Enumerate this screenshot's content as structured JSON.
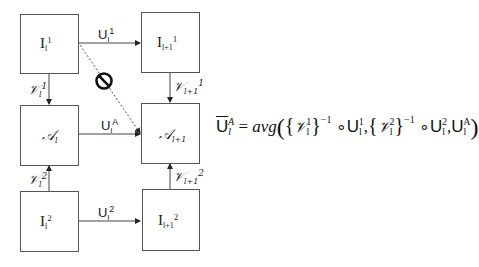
{
  "diagram": {
    "nodes": [
      {
        "id": "I_l_1",
        "base": "I",
        "sub": "l",
        "sup": "1"
      },
      {
        "id": "I_l1_1",
        "base": "I",
        "sub": "l+1",
        "sup": "1"
      },
      {
        "id": "A_l",
        "base": "𝒜",
        "sub": "l",
        "sup": ""
      },
      {
        "id": "A_l1",
        "base": "𝒜",
        "sub": "l+1",
        "sup": ""
      },
      {
        "id": "I_l_2",
        "base": "I",
        "sub": "l",
        "sup": "2"
      },
      {
        "id": "I_l1_2",
        "base": "I",
        "sub": "l+1",
        "sup": "2"
      }
    ],
    "edges": [
      {
        "from": "I_l_1",
        "to": "I_l1_1",
        "base": "U",
        "sub": "l",
        "sup": "1"
      },
      {
        "from": "A_l",
        "to": "A_l1",
        "base": "U",
        "sub": "l",
        "sup": "A"
      },
      {
        "from": "I_l_2",
        "to": "I_l1_2",
        "base": "U",
        "sub": "l",
        "sup": "2"
      },
      {
        "from": "I_l_1",
        "to": "A_l",
        "base": "𝒱",
        "sub": "l",
        "sup": "1"
      },
      {
        "from": "I_l1_1",
        "to": "A_l1",
        "base": "𝒱",
        "sub": "l+1",
        "sup": "1"
      },
      {
        "from": "I_l_2",
        "to": "A_l",
        "base": "𝒱",
        "sub": "l",
        "sup": "2"
      },
      {
        "from": "I_l1_2",
        "to": "A_l1",
        "base": "𝒱",
        "sub": "l+1",
        "sup": "2"
      },
      {
        "from": "I_l_1",
        "to": "A_l1",
        "style": "dashed",
        "marker": "prohibited-icon"
      }
    ],
    "equation": {
      "lhs_base": "U",
      "lhs_sub": "l",
      "lhs_sup": "A",
      "equals": "=",
      "func": "avg",
      "open": "(",
      "brace_open": "{",
      "brace_close": "}",
      "v_base": "𝒱",
      "v1_sup": "1",
      "v2_sup": "2",
      "v_sub": "l",
      "inv": "−1",
      "compose": "∘",
      "u_base": "U",
      "u1_sup": "1",
      "u2_sup": "2",
      "uA_sup": "A",
      "u_sub": "l",
      "comma": ",",
      "close": ")"
    }
  }
}
